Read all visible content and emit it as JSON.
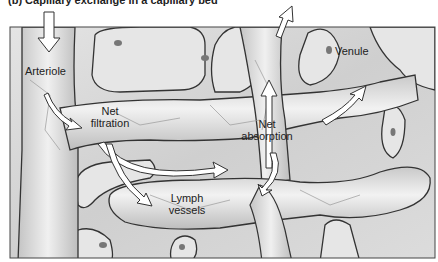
{
  "figure": {
    "caption": "(b) Capillary exchange in a capillary bed",
    "labels": {
      "arteriole": "Arteriole",
      "venule": "Venule",
      "net_filtration_1": "Net",
      "net_filtration_2": "filtration",
      "net_absorption_1": "Net",
      "net_absorption_2": "absorption",
      "lymph_1": "Lymph",
      "lymph_2": "vessels"
    },
    "arrows": [
      {
        "name": "blood-in-arrow",
        "direction": "down",
        "location": "arteriole top"
      },
      {
        "name": "arteriole-to-capillary-arrow",
        "direction": "down-right"
      },
      {
        "name": "filtration-to-absorption-arrow",
        "direction": "right (curved)"
      },
      {
        "name": "filtration-to-lymph-arrow",
        "direction": "down-right (curved)"
      },
      {
        "name": "absorption-to-venule-arrow",
        "direction": "up-right"
      },
      {
        "name": "venule-blood-out-arrow",
        "direction": "up"
      },
      {
        "name": "venule-exit-arrow",
        "direction": "up-right",
        "location": "top outside frame"
      },
      {
        "name": "lymph-drainage-arrow",
        "direction": "down (curved)"
      }
    ],
    "colors": {
      "background": "#ffffff",
      "tissue": "#d9d9d9",
      "vessel": "#ececec",
      "outline": "#333333",
      "arrow_fill": "#ffffff"
    }
  }
}
